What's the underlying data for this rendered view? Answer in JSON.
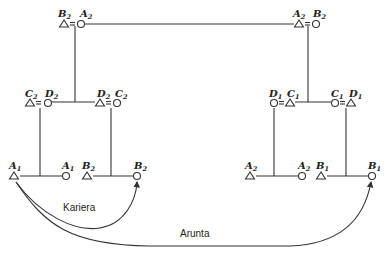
{
  "diagram": {
    "type": "kinship-diagram",
    "captions": {
      "kariera": "Kariera",
      "arunta": "Arunta"
    },
    "couples": [
      {
        "id": "top-left",
        "left": {
          "sym": "triangle",
          "letter": "B",
          "sub": "2"
        },
        "right": {
          "sym": "circle",
          "letter": "A",
          "sub": "2"
        }
      },
      {
        "id": "top-right",
        "left": {
          "sym": "triangle",
          "letter": "A",
          "sub": "2"
        },
        "right": {
          "sym": "circle",
          "letter": "B",
          "sub": "2"
        }
      },
      {
        "id": "mid-left-1",
        "left": {
          "sym": "triangle",
          "letter": "C",
          "sub": "2"
        },
        "right": {
          "sym": "circle",
          "letter": "D",
          "sub": "2"
        }
      },
      {
        "id": "mid-left-2",
        "left": {
          "sym": "triangle",
          "letter": "D",
          "sub": "2"
        },
        "right": {
          "sym": "circle",
          "letter": "C",
          "sub": "2"
        }
      },
      {
        "id": "mid-right-1",
        "left": {
          "sym": "circle",
          "letter": "D",
          "sub": "1"
        },
        "right": {
          "sym": "triangle",
          "letter": "C",
          "sub": "1"
        }
      },
      {
        "id": "mid-right-2",
        "left": {
          "sym": "circle",
          "letter": "C",
          "sub": "1"
        },
        "right": {
          "sym": "triangle",
          "letter": "D",
          "sub": "1"
        }
      }
    ],
    "sibling_pairs": [
      {
        "id": "bottom-1",
        "left": {
          "sym": "triangle",
          "letter": "A",
          "sub": "1"
        },
        "right": {
          "sym": "circle",
          "letter": "A",
          "sub": "1"
        }
      },
      {
        "id": "bottom-2",
        "left": {
          "sym": "triangle",
          "letter": "B",
          "sub": "2"
        },
        "right": {
          "sym": "circle",
          "letter": "B",
          "sub": "2"
        }
      },
      {
        "id": "bottom-3",
        "left": {
          "sym": "triangle",
          "letter": "A",
          "sub": "2"
        },
        "right": {
          "sym": "circle",
          "letter": "A",
          "sub": "2"
        }
      },
      {
        "id": "bottom-4",
        "left": {
          "sym": "triangle",
          "letter": "B",
          "sub": "1"
        },
        "right": {
          "sym": "circle",
          "letter": "B",
          "sub": "1"
        }
      }
    ],
    "arrows": [
      {
        "id": "kariera-arrow",
        "from": "A1 male",
        "to": "B2 female",
        "label": "Kariera"
      },
      {
        "id": "arunta-arrow",
        "from": "A1 male",
        "to": "B1 female",
        "label": "Arunta"
      }
    ]
  }
}
